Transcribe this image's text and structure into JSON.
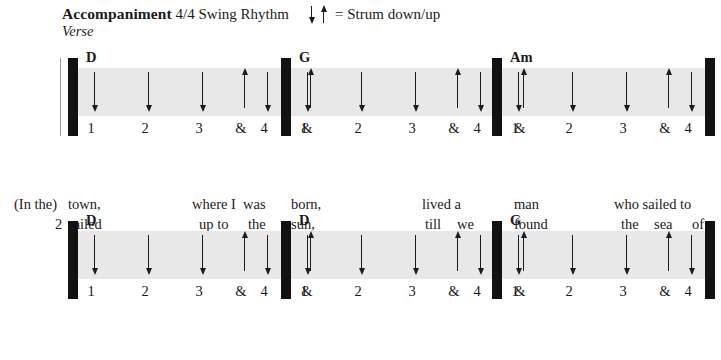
{
  "header": {
    "title_strong": "Accompaniment",
    "title_rest": " 4/4 Swing Rhythm",
    "section_label": "Verse",
    "legend_text": "= Strum down/up",
    "legend_down_icon": "arrow-down-icon",
    "legend_up_icon": "arrow-up-icon"
  },
  "beats": {
    "b1": "1",
    "b2": "2",
    "b3": "3",
    "b3and": "&",
    "b4": "4",
    "b4and": "&"
  },
  "strum_pattern": [
    "down",
    "down",
    "down",
    "up",
    "down",
    "up"
  ],
  "systems": [
    {
      "name": "system-1",
      "measures": [
        {
          "chord": "D"
        },
        {
          "chord": "G"
        },
        {
          "chord": "Am"
        }
      ],
      "lyrics": {
        "line1": [
          {
            "text": "(In the)",
            "x": 14
          },
          {
            "text": "town,",
            "x": 68
          },
          {
            "text": "where I",
            "x": 192
          },
          {
            "text": "was",
            "x": 243
          },
          {
            "text": "born,",
            "x": 291
          },
          {
            "text": "lived a",
            "x": 422
          },
          {
            "text": "man",
            "x": 514
          },
          {
            "text": "who sailed to",
            "x": 614
          }
        ],
        "line2": [
          {
            "text": "2",
            "x": 55
          },
          {
            "text": "sailed",
            "x": 68
          },
          {
            "text": "up to",
            "x": 199
          },
          {
            "text": "the",
            "x": 248
          },
          {
            "text": "sun,",
            "x": 291
          },
          {
            "text": "till",
            "x": 425
          },
          {
            "text": "we",
            "x": 457
          },
          {
            "text": "found",
            "x": 514
          },
          {
            "text": "the",
            "x": 621
          },
          {
            "text": "sea",
            "x": 654
          },
          {
            "text": "of",
            "x": 692
          }
        ]
      }
    },
    {
      "name": "system-2",
      "measures": [
        {
          "chord": "D"
        },
        {
          "chord": "D"
        },
        {
          "chord": "G"
        }
      ],
      "lyrics": {
        "line1": [
          {
            "text": "1",
            "x": 51
          },
          {
            "text": "sea,",
            "x": 75
          },
          {
            "text": "and",
            "x": 224
          },
          {
            "text": "he",
            "x": 256
          },
          {
            "text": "told",
            "x": 290
          },
          {
            "text": "us of",
            "x": 423
          },
          {
            "text": "his",
            "x": 470
          },
          {
            "text": "life,",
            "x": 510
          },
          {
            "text": "in",
            "x": 644
          },
          {
            "text": "the",
            "x": 673
          }
        ],
        "line2": [
          {
            "text": "2",
            "x": 51
          },
          {
            "text": "green,",
            "x": 75
          },
          {
            "text": "and",
            "x": 224
          },
          {
            "text": "we",
            "x": 256
          },
          {
            "text": "lived",
            "x": 290
          },
          {
            "text": "beneath",
            "x": 414
          },
          {
            "text": "the",
            "x": 473
          },
          {
            "text": "waves",
            "x": 510
          },
          {
            "text": "in",
            "x": 644
          },
          {
            "text": "our",
            "x": 673
          }
        ]
      }
    }
  ],
  "colors": {
    "band": "#e8e8e8",
    "ink": "#1c1c1c",
    "barline": "#121212",
    "page": "#ffffff"
  }
}
